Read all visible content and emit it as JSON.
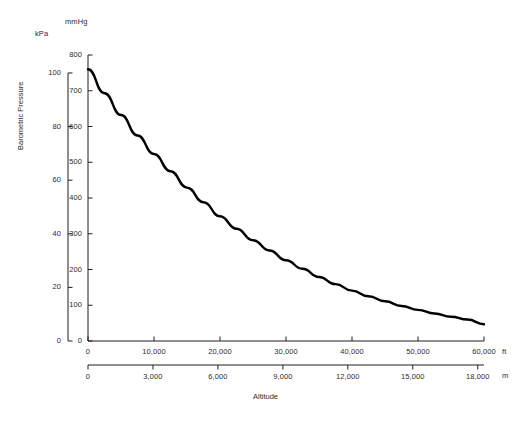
{
  "chart_data": {
    "type": "line",
    "title": "",
    "xlabel": "Altitude",
    "ylabel": "Barometric Pressure",
    "grid": false,
    "legend": "none",
    "line_color": "#000000",
    "axes": {
      "y_primary": {
        "unit": "mmHg",
        "ticks": [
          0,
          100,
          200,
          300,
          400,
          500,
          600,
          700,
          800
        ],
        "tick_labels": [
          "0",
          "100",
          "200",
          "300",
          "400",
          "500",
          "600",
          "700",
          "800"
        ],
        "range": [
          0,
          800
        ]
      },
      "y_secondary": {
        "unit": "kPa",
        "ticks": [
          0,
          20,
          40,
          60,
          80,
          100
        ],
        "tick_labels": [
          "0",
          "20",
          "40",
          "60",
          "80",
          "100"
        ],
        "range": [
          0,
          106.7
        ]
      },
      "x_primary": {
        "unit": "ft",
        "ticks": [
          0,
          10000,
          20000,
          30000,
          40000,
          50000,
          60000
        ],
        "tick_labels": [
          "0",
          "10,000",
          "20,000",
          "30,000",
          "40,000",
          "50,000",
          "60,000"
        ],
        "range": [
          0,
          60000
        ]
      },
      "x_secondary": {
        "unit": "m",
        "ticks": [
          0,
          3000,
          6000,
          9000,
          12000,
          15000,
          18000
        ],
        "tick_labels": [
          "0",
          "3,000",
          "6,000",
          "9,000",
          "12,000",
          "15,000",
          "18,000"
        ],
        "range": [
          0,
          18288
        ]
      }
    },
    "x": [
      0,
      2500,
      5000,
      7500,
      10000,
      12500,
      15000,
      17500,
      20000,
      22500,
      25000,
      27500,
      30000,
      32500,
      35000,
      37500,
      40000,
      42500,
      45000,
      47500,
      50000,
      52500,
      55000,
      57500,
      60000
    ],
    "values": [
      760,
      693,
      632,
      575,
      523,
      475,
      429,
      388,
      349,
      314,
      282,
      253,
      226,
      202,
      179,
      159,
      141,
      125,
      111,
      98,
      87,
      77,
      68,
      60,
      47
    ]
  },
  "labels": {
    "y_primary_unit": "mmHg",
    "y_secondary_unit": "kPa",
    "x_primary_unit": "ft",
    "x_secondary_unit": "m",
    "axis_title_y": "Barometric Pressure",
    "axis_title_x": "Altitude"
  }
}
